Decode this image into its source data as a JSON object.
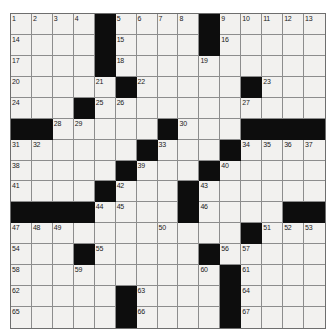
{
  "puzzle": {
    "title": "Crossword Puzzle Grid",
    "rows": 15,
    "cols": 15,
    "colors": {
      "block": "#0d0d0d",
      "cell": "#f2f1ef",
      "grid_line": "#8d8d8d",
      "number_text": "#1a1a1a",
      "background": "#ffffff"
    },
    "grid": [
      [
        {
          "num": "1",
          "block": false
        },
        {
          "num": "2",
          "block": false
        },
        {
          "num": "3",
          "block": false
        },
        {
          "num": "4",
          "block": false
        },
        {
          "num": "",
          "block": true
        },
        {
          "num": "5",
          "block": false
        },
        {
          "num": "6",
          "block": false
        },
        {
          "num": "7",
          "block": false
        },
        {
          "num": "8",
          "block": false
        },
        {
          "num": "",
          "block": true
        },
        {
          "num": "9",
          "block": false
        },
        {
          "num": "10",
          "block": false
        },
        {
          "num": "11",
          "block": false
        },
        {
          "num": "12",
          "block": false
        },
        {
          "num": "13",
          "block": false
        }
      ],
      [
        {
          "num": "14",
          "block": false
        },
        {
          "num": "",
          "block": false
        },
        {
          "num": "",
          "block": false
        },
        {
          "num": "",
          "block": false
        },
        {
          "num": "",
          "block": true
        },
        {
          "num": "15",
          "block": false
        },
        {
          "num": "",
          "block": false
        },
        {
          "num": "",
          "block": false
        },
        {
          "num": "",
          "block": false
        },
        {
          "num": "",
          "block": true
        },
        {
          "num": "16",
          "block": false
        },
        {
          "num": "",
          "block": false
        },
        {
          "num": "",
          "block": false
        },
        {
          "num": "",
          "block": false
        },
        {
          "num": "",
          "block": false
        }
      ],
      [
        {
          "num": "17",
          "block": false
        },
        {
          "num": "",
          "block": false
        },
        {
          "num": "",
          "block": false
        },
        {
          "num": "",
          "block": false
        },
        {
          "num": "",
          "block": true
        },
        {
          "num": "18",
          "block": false
        },
        {
          "num": "",
          "block": false
        },
        {
          "num": "",
          "block": false
        },
        {
          "num": "",
          "block": false
        },
        {
          "num": "19",
          "block": false
        },
        {
          "num": "",
          "block": false
        },
        {
          "num": "",
          "block": false
        },
        {
          "num": "",
          "block": false
        },
        {
          "num": "",
          "block": false
        },
        {
          "num": "",
          "block": false
        }
      ],
      [
        {
          "num": "20",
          "block": false
        },
        {
          "num": "",
          "block": false
        },
        {
          "num": "",
          "block": false
        },
        {
          "num": "",
          "block": false
        },
        {
          "num": "21",
          "block": false
        },
        {
          "num": "",
          "block": true
        },
        {
          "num": "22",
          "block": false
        },
        {
          "num": "",
          "block": false
        },
        {
          "num": "",
          "block": false
        },
        {
          "num": "",
          "block": false
        },
        {
          "num": "",
          "block": false
        },
        {
          "num": "",
          "block": true
        },
        {
          "num": "23",
          "block": false
        },
        {
          "num": "",
          "block": false
        },
        {
          "num": "",
          "block": false
        }
      ],
      [
        {
          "num": "24",
          "block": false
        },
        {
          "num": "",
          "block": false
        },
        {
          "num": "",
          "block": false
        },
        {
          "num": "",
          "block": true
        },
        {
          "num": "25",
          "block": false
        },
        {
          "num": "26",
          "block": false
        },
        {
          "num": "",
          "block": false
        },
        {
          "num": "",
          "block": false
        },
        {
          "num": "",
          "block": false
        },
        {
          "num": "",
          "block": false
        },
        {
          "num": "",
          "block": false
        },
        {
          "num": "27",
          "block": false
        },
        {
          "num": "",
          "block": false
        },
        {
          "num": "",
          "block": false
        },
        {
          "num": "",
          "block": false
        }
      ],
      [
        {
          "num": "",
          "block": true
        },
        {
          "num": "",
          "block": true
        },
        {
          "num": "28",
          "block": false
        },
        {
          "num": "29",
          "block": false
        },
        {
          "num": "",
          "block": false
        },
        {
          "num": "",
          "block": false
        },
        {
          "num": "",
          "block": false
        },
        {
          "num": "",
          "block": true
        },
        {
          "num": "30",
          "block": false
        },
        {
          "num": "",
          "block": false
        },
        {
          "num": "",
          "block": false
        },
        {
          "num": "",
          "block": true
        },
        {
          "num": "",
          "block": true
        },
        {
          "num": "",
          "block": true
        },
        {
          "num": "",
          "block": true
        }
      ],
      [
        {
          "num": "31",
          "block": false
        },
        {
          "num": "32",
          "block": false
        },
        {
          "num": "",
          "block": false
        },
        {
          "num": "",
          "block": false
        },
        {
          "num": "",
          "block": false
        },
        {
          "num": "",
          "block": false
        },
        {
          "num": "",
          "block": true
        },
        {
          "num": "33",
          "block": false
        },
        {
          "num": "",
          "block": false
        },
        {
          "num": "",
          "block": false
        },
        {
          "num": "",
          "block": true
        },
        {
          "num": "34",
          "block": false
        },
        {
          "num": "35",
          "block": false
        },
        {
          "num": "36",
          "block": false
        },
        {
          "num": "37",
          "block": false
        }
      ],
      [
        {
          "num": "38",
          "block": false
        },
        {
          "num": "",
          "block": false
        },
        {
          "num": "",
          "block": false
        },
        {
          "num": "",
          "block": false
        },
        {
          "num": "",
          "block": false
        },
        {
          "num": "",
          "block": true
        },
        {
          "num": "39",
          "block": false
        },
        {
          "num": "",
          "block": false
        },
        {
          "num": "",
          "block": false
        },
        {
          "num": "",
          "block": true
        },
        {
          "num": "40",
          "block": false
        },
        {
          "num": "",
          "block": false
        },
        {
          "num": "",
          "block": false
        },
        {
          "num": "",
          "block": false
        },
        {
          "num": "",
          "block": false
        }
      ],
      [
        {
          "num": "41",
          "block": false
        },
        {
          "num": "",
          "block": false
        },
        {
          "num": "",
          "block": false
        },
        {
          "num": "",
          "block": false
        },
        {
          "num": "",
          "block": true
        },
        {
          "num": "42",
          "block": false
        },
        {
          "num": "",
          "block": false
        },
        {
          "num": "",
          "block": false
        },
        {
          "num": "",
          "block": true
        },
        {
          "num": "43",
          "block": false
        },
        {
          "num": "",
          "block": false
        },
        {
          "num": "",
          "block": false
        },
        {
          "num": "",
          "block": false
        },
        {
          "num": "",
          "block": false
        },
        {
          "num": "",
          "block": false
        }
      ],
      [
        {
          "num": "",
          "block": true
        },
        {
          "num": "",
          "block": true
        },
        {
          "num": "",
          "block": true
        },
        {
          "num": "",
          "block": true
        },
        {
          "num": "44",
          "block": false
        },
        {
          "num": "45",
          "block": false
        },
        {
          "num": "",
          "block": false
        },
        {
          "num": "",
          "block": false
        },
        {
          "num": "",
          "block": true
        },
        {
          "num": "46",
          "block": false
        },
        {
          "num": "",
          "block": false
        },
        {
          "num": "",
          "block": false
        },
        {
          "num": "",
          "block": false
        },
        {
          "num": "",
          "block": true
        },
        {
          "num": "",
          "block": true
        }
      ],
      [
        {
          "num": "47",
          "block": false
        },
        {
          "num": "48",
          "block": false
        },
        {
          "num": "49",
          "block": false
        },
        {
          "num": "",
          "block": false
        },
        {
          "num": "",
          "block": false
        },
        {
          "num": "",
          "block": false
        },
        {
          "num": "",
          "block": false
        },
        {
          "num": "50",
          "block": false
        },
        {
          "num": "",
          "block": false
        },
        {
          "num": "",
          "block": false
        },
        {
          "num": "",
          "block": false
        },
        {
          "num": "",
          "block": true
        },
        {
          "num": "51",
          "block": false
        },
        {
          "num": "52",
          "block": false
        },
        {
          "num": "53",
          "block": false
        }
      ],
      [
        {
          "num": "54",
          "block": false
        },
        {
          "num": "",
          "block": false
        },
        {
          "num": "",
          "block": false
        },
        {
          "num": "",
          "block": true
        },
        {
          "num": "55",
          "block": false
        },
        {
          "num": "",
          "block": false
        },
        {
          "num": "",
          "block": false
        },
        {
          "num": "",
          "block": false
        },
        {
          "num": "",
          "block": false
        },
        {
          "num": "",
          "block": true
        },
        {
          "num": "56",
          "block": false
        },
        {
          "num": "57",
          "block": false
        },
        {
          "num": "",
          "block": false
        },
        {
          "num": "",
          "block": false
        },
        {
          "num": "",
          "block": false
        }
      ],
      [
        {
          "num": "58",
          "block": false
        },
        {
          "num": "",
          "block": false
        },
        {
          "num": "",
          "block": false
        },
        {
          "num": "59",
          "block": false
        },
        {
          "num": "",
          "block": false
        },
        {
          "num": "",
          "block": false
        },
        {
          "num": "",
          "block": false
        },
        {
          "num": "",
          "block": false
        },
        {
          "num": "",
          "block": false
        },
        {
          "num": "60",
          "block": false
        },
        {
          "num": "",
          "block": true
        },
        {
          "num": "61",
          "block": false
        },
        {
          "num": "",
          "block": false
        },
        {
          "num": "",
          "block": false
        },
        {
          "num": "",
          "block": false
        }
      ],
      [
        {
          "num": "62",
          "block": false
        },
        {
          "num": "",
          "block": false
        },
        {
          "num": "",
          "block": false
        },
        {
          "num": "",
          "block": false
        },
        {
          "num": "",
          "block": false
        },
        {
          "num": "",
          "block": true
        },
        {
          "num": "63",
          "block": false
        },
        {
          "num": "",
          "block": false
        },
        {
          "num": "",
          "block": false
        },
        {
          "num": "",
          "block": false
        },
        {
          "num": "",
          "block": true
        },
        {
          "num": "64",
          "block": false
        },
        {
          "num": "",
          "block": false
        },
        {
          "num": "",
          "block": false
        },
        {
          "num": "",
          "block": false
        }
      ],
      [
        {
          "num": "65",
          "block": false
        },
        {
          "num": "",
          "block": false
        },
        {
          "num": "",
          "block": false
        },
        {
          "num": "",
          "block": false
        },
        {
          "num": "",
          "block": false
        },
        {
          "num": "",
          "block": true
        },
        {
          "num": "66",
          "block": false
        },
        {
          "num": "",
          "block": false
        },
        {
          "num": "",
          "block": false
        },
        {
          "num": "",
          "block": false
        },
        {
          "num": "",
          "block": true
        },
        {
          "num": "67",
          "block": false
        },
        {
          "num": "",
          "block": false
        },
        {
          "num": "",
          "block": false
        },
        {
          "num": "",
          "block": false
        }
      ]
    ]
  }
}
